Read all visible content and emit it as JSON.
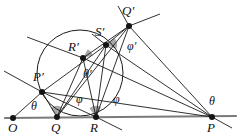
{
  "figure": {
    "background": "#ffffff",
    "stroke_color": "#1a1a1a",
    "vertex_color": "#141414",
    "sector_fill": "#9a9a9a",
    "baseline_color": "#7a7a7a",
    "width": 240,
    "height": 137
  },
  "points": [
    {
      "name": "O",
      "label": "O",
      "x": 13,
      "y": 118,
      "label_x": 8,
      "label_y": 121
    },
    {
      "name": "Q",
      "label": "Q",
      "x": 57,
      "y": 117,
      "label_x": 51,
      "label_y": 121
    },
    {
      "name": "R",
      "label": "R",
      "x": 96,
      "y": 117,
      "label_x": 90,
      "label_y": 121
    },
    {
      "name": "P",
      "label": "P",
      "x": 212,
      "y": 117,
      "label_x": 207,
      "label_y": 121
    },
    {
      "name": "P'",
      "label": "P′",
      "x": 42,
      "y": 92,
      "label_x": 33,
      "label_y": 70
    },
    {
      "name": "R'",
      "label": "R′",
      "x": 83,
      "y": 58,
      "label_x": 68,
      "label_y": 40
    },
    {
      "name": "S'",
      "label": "S′",
      "x": 106,
      "y": 45,
      "label_x": 95,
      "label_y": 25
    },
    {
      "name": "Q'",
      "label": "Q′",
      "x": 129,
      "y": 26,
      "label_x": 122,
      "label_y": 4
    }
  ],
  "angle_labels": [
    {
      "name": "theta-at-P-prime",
      "text": "θ",
      "x": 31,
      "y": 100
    },
    {
      "name": "phi-at-Q",
      "text": "φ",
      "x": 76,
      "y": 93
    },
    {
      "name": "theta-prime-at-R-prime",
      "text": "θ′",
      "x": 83,
      "y": 68
    },
    {
      "name": "phi-at-R",
      "text": "φ",
      "x": 113,
      "y": 93
    },
    {
      "name": "phi-prime-at-Q-prime",
      "text": "φ′",
      "x": 127,
      "y": 40
    },
    {
      "name": "theta-at-P",
      "text": "θ",
      "x": 209,
      "y": 95
    }
  ],
  "circle": {
    "cx": 80,
    "cy": 73,
    "r": 43
  },
  "baseline": {
    "x1": 5,
    "y1": 118,
    "x2": 236,
    "y2": 116
  },
  "segments": [
    {
      "name": "O-to-P-prime",
      "x1": 13,
      "y1": 118,
      "x2": 42,
      "y2": 92
    },
    {
      "name": "line-through-P-prime-upper-left",
      "x1": 4,
      "y1": 71,
      "x2": 42,
      "y2": 92
    },
    {
      "name": "P-prime-to-P",
      "x1": 42,
      "y1": 92,
      "x2": 212,
      "y2": 117
    },
    {
      "name": "P-prime-to-S-prime",
      "x1": 42,
      "y1": 92,
      "x2": 106,
      "y2": 45
    },
    {
      "name": "P-prime-to-Q",
      "x1": 42,
      "y1": 92,
      "x2": 57,
      "y2": 117
    },
    {
      "name": "P-prime-to-R",
      "x1": 42,
      "y1": 92,
      "x2": 96,
      "y2": 117
    },
    {
      "name": "line-through-R-prime-left",
      "x1": 27,
      "y1": 37,
      "x2": 83,
      "y2": 58
    },
    {
      "name": "R-prime-to-Q-prime",
      "x1": 83,
      "y1": 58,
      "x2": 129,
      "y2": 26
    },
    {
      "name": "R-prime-to-P",
      "x1": 83,
      "y1": 58,
      "x2": 212,
      "y2": 117
    },
    {
      "name": "R-prime-to-Q",
      "x1": 83,
      "y1": 58,
      "x2": 57,
      "y2": 117
    },
    {
      "name": "R-prime-to-R",
      "x1": 83,
      "y1": 58,
      "x2": 96,
      "y2": 117
    },
    {
      "name": "S-prime-to-Q",
      "x1": 106,
      "y1": 45,
      "x2": 57,
      "y2": 117
    },
    {
      "name": "S-prime-to-R",
      "x1": 106,
      "y1": 45,
      "x2": 96,
      "y2": 117
    },
    {
      "name": "S-prime-to-P",
      "x1": 106,
      "y1": 45,
      "x2": 212,
      "y2": 117
    },
    {
      "name": "S-prime-to-Q-prime",
      "x1": 106,
      "y1": 45,
      "x2": 129,
      "y2": 26
    },
    {
      "name": "Q-prime-to-P",
      "x1": 129,
      "y1": 26,
      "x2": 212,
      "y2": 117
    },
    {
      "name": "Q-prime-to-R",
      "x1": 129,
      "y1": 26,
      "x2": 96,
      "y2": 117
    },
    {
      "name": "Q-prime-to-Q",
      "x1": 129,
      "y1": 26,
      "x2": 57,
      "y2": 117
    },
    {
      "name": "Q-prime-ray-upper-right",
      "x1": 129,
      "y1": 26,
      "x2": 160,
      "y2": 14
    },
    {
      "name": "Q-prime-ray-upper-left",
      "x1": 129,
      "y1": 26,
      "x2": 118,
      "y2": 6
    },
    {
      "name": "R-to-lower-right-ray",
      "x1": 96,
      "y1": 117,
      "x2": 122,
      "y2": 130
    },
    {
      "name": "P-ray-lower-right",
      "x1": 212,
      "y1": 117,
      "x2": 232,
      "y2": 128
    },
    {
      "name": "S-prime-ray-upper-left",
      "x1": 106,
      "y1": 45,
      "x2": 92,
      "y2": 34
    }
  ],
  "sectors": [
    {
      "name": "sector-at-Q",
      "cx": 57,
      "cy": 117,
      "r": 11,
      "a1": 236,
      "a2": 299
    },
    {
      "name": "sector-at-R",
      "cx": 96,
      "cy": 117,
      "r": 11,
      "a1": 233,
      "a2": 297
    },
    {
      "name": "sector-at-R-prime",
      "cx": 83,
      "cy": 58,
      "r": 10,
      "a1": 298,
      "a2": 345
    },
    {
      "name": "sector-at-S-prime",
      "cx": 106,
      "cy": 45,
      "r": 11,
      "a1": 320,
      "a2": 20
    }
  ]
}
